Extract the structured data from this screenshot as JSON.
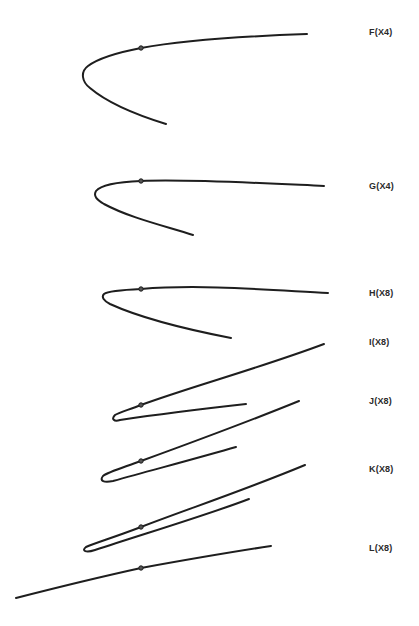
{
  "figure": {
    "curves": [
      {
        "id": "F",
        "label": "F(X4)",
        "label_y": 27,
        "path": "M 307 34 C 250 36, 190 39, 141 48 C 115 53, 96 60, 88 66 C 80 72, 82 82, 90 88 C 110 105, 140 116, 166 124",
        "dot": [
          141,
          48
        ]
      },
      {
        "id": "G",
        "label": "G(X4)",
        "label_y": 181,
        "path": "M 324 186 C 260 183, 190 179, 141 181 C 115 182, 100 186, 96 191 C 93 196, 97 200, 104 204 C 130 218, 165 226, 193 235",
        "dot": [
          141,
          181
        ]
      },
      {
        "id": "H",
        "label": "H(X8)",
        "label_y": 288,
        "path": "M 328 293 C 270 290, 200 284, 141 289 C 120 290, 108 291, 104 294 C 101 297, 104 301, 110 304 C 145 320, 195 331, 231 338",
        "dot": [
          141,
          289
        ]
      },
      {
        "id": "I",
        "label": "I(X8)",
        "label_y": 337,
        "path": "M 324 344 C 260 368, 190 387, 141 405 C 128 410, 118 413, 115 415 C 111 419, 114 422, 120 420 C 160 414, 210 408, 246 404",
        "dot": [
          141,
          405
        ]
      },
      {
        "id": "J",
        "label": "J(X8)",
        "label_y": 396,
        "path": "M 299 401 C 240 425, 185 445, 141 461 C 122 468, 108 472, 103 476 C 99 481, 104 483, 113 481 C 160 468, 205 456, 236 447",
        "dot": [
          141,
          461
        ]
      },
      {
        "id": "K",
        "label": "K(X8)",
        "label_y": 464,
        "path": "M 305 465 C 245 490, 185 510, 141 527 C 115 537, 95 543, 86 547 C 81 551, 86 553, 95 550 C 150 532, 210 514, 249 499",
        "dot": [
          141,
          527
        ]
      },
      {
        "id": "L",
        "label": "L(X8)",
        "label_y": 543,
        "path": "M 271 546 C 225 553, 185 560, 141 568 C 100 577, 55 588, 16 598",
        "dot": [
          141,
          568
        ]
      }
    ]
  }
}
